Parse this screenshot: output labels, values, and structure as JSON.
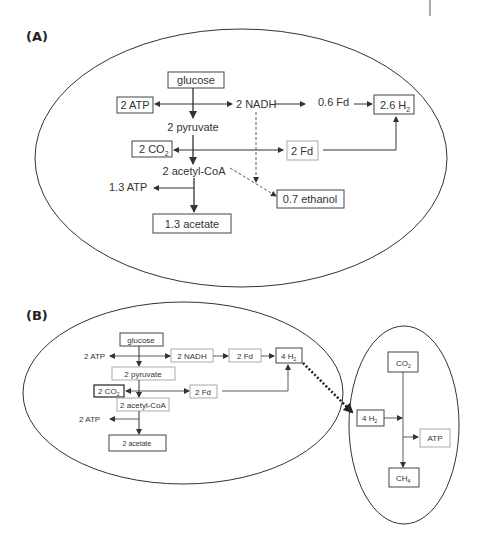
{
  "panel_a": {
    "label": "(A)",
    "nodes": {
      "glucose": "glucose",
      "atp_left": "2 ATP",
      "nadh": "2 NADH",
      "fd_06": "0.6 Fd",
      "h2": "2.6 H",
      "h2_sub": "2",
      "pyruvate": "2 pyruvate",
      "co2": "2 CO",
      "co2_sub": "2",
      "fd_2": "2 Fd",
      "acetyl_coa": "2 acetyl-CoA",
      "atp_13": "1.3 ATP",
      "ethanol": "0.7 ethanol",
      "acetate": "1.3 acetate"
    }
  },
  "panel_b": {
    "label": "(B)",
    "left_cell": {
      "glucose": "glucose",
      "atp_left": "2 ATP",
      "nadh": "2 NADH",
      "fd_top": "2 Fd",
      "h2": "4 H",
      "h2_sub": "2",
      "pyruvate": "2 pyruvate",
      "co2": "2 CO",
      "co2_sub": "2",
      "fd_mid": "2 Fd",
      "acetyl_coa": "2 acetyl-CoA",
      "atp_bottom": "2 ATP",
      "acetate": "2 acetate"
    },
    "right_cell": {
      "co2": "CO",
      "co2_sub": "2",
      "h2": "4 H",
      "h2_sub": "2",
      "atp": "ATP",
      "ch4": "CH",
      "ch4_sub": "4"
    }
  },
  "colors": {
    "line": "#333333",
    "light_box": "#aaaaaa",
    "text": "#333333"
  }
}
